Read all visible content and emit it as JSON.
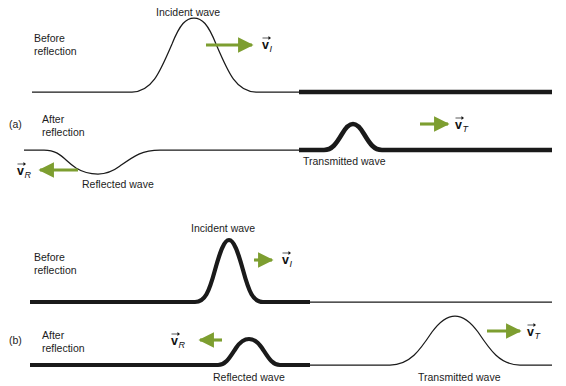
{
  "figure": {
    "background_color": "#ffffff",
    "arrow_color": "#7d9e30",
    "line_color": "#1a1a1a"
  },
  "labels": {
    "incident_wave": "Incident wave",
    "reflected_wave": "Reflected wave",
    "transmitted_wave": "Transmitted wave",
    "before_reflection_line1": "Before",
    "before_reflection_line2": "reflection",
    "after_reflection_line1": "After",
    "after_reflection_line2": "reflection",
    "panel_a": "(a)",
    "panel_b": "(b)"
  },
  "vectors": {
    "v_symbol": "v",
    "incident_subscript": "I",
    "reflected_subscript": "R",
    "transmitted_subscript": "T"
  },
  "panels": [
    {
      "id": "a",
      "panel_label": "(a)",
      "description": "Pulse travels from a light (thin) string toward a heavy (thick) string; the reflected pulse is inverted and the transmitted pulse is small.",
      "rows": [
        {
          "id": "a-before",
          "state": "Before reflection",
          "medium_left": "thin",
          "medium_right": "thick",
          "pulses": [
            {
              "name": "incident_wave",
              "label": "Incident wave",
              "orientation": "upright",
              "medium": "thin",
              "vector_label": "v",
              "vector_subscript": "I",
              "arrow_direction": "right"
            }
          ]
        },
        {
          "id": "a-after",
          "state": "After reflection",
          "medium_left": "thin",
          "medium_right": "thick",
          "pulses": [
            {
              "name": "reflected_wave",
              "label": "Reflected wave",
              "orientation": "inverted",
              "medium": "thin",
              "vector_label": "v",
              "vector_subscript": "R",
              "arrow_direction": "left"
            },
            {
              "name": "transmitted_wave",
              "label": "Transmitted wave",
              "orientation": "upright",
              "medium": "thick",
              "vector_label": "v",
              "vector_subscript": "T",
              "arrow_direction": "right"
            }
          ]
        }
      ]
    },
    {
      "id": "b",
      "panel_label": "(b)",
      "description": "Pulse travels from a heavy (thick) string toward a light (thin) string; the reflected pulse is upright and the transmitted pulse is broad.",
      "rows": [
        {
          "id": "b-before",
          "state": "Before reflection",
          "medium_left": "thick",
          "medium_right": "thin",
          "pulses": [
            {
              "name": "incident_wave",
              "label": "Incident wave",
              "orientation": "upright",
              "medium": "thick",
              "vector_label": "v",
              "vector_subscript": "I",
              "arrow_direction": "right"
            }
          ]
        },
        {
          "id": "b-after",
          "state": "After reflection",
          "medium_left": "thick",
          "medium_right": "thin",
          "pulses": [
            {
              "name": "reflected_wave",
              "label": "Reflected wave",
              "orientation": "upright",
              "medium": "thick",
              "vector_label": "v",
              "vector_subscript": "R",
              "arrow_direction": "left"
            },
            {
              "name": "transmitted_wave",
              "label": "Transmitted wave",
              "orientation": "upright",
              "medium": "thin",
              "vector_label": "v",
              "vector_subscript": "T",
              "arrow_direction": "right"
            }
          ]
        }
      ]
    }
  ]
}
